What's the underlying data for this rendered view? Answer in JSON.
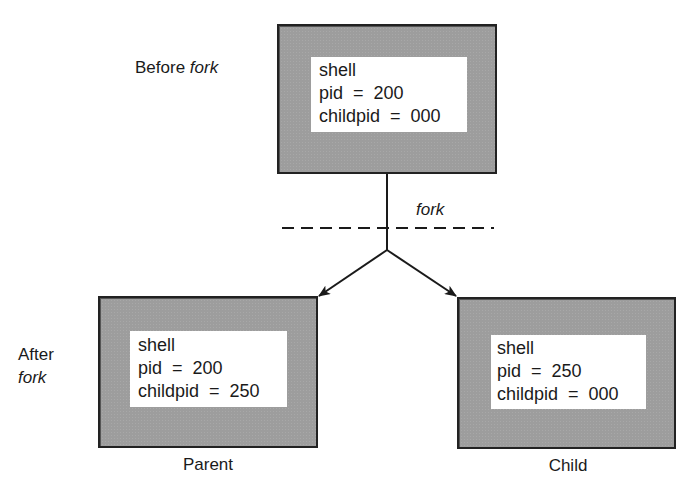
{
  "diagram": {
    "labels": {
      "before_prefix": "Before ",
      "before_italic": "fork",
      "after_line1": "After",
      "after_line2": "fork",
      "fork_edge": "fork"
    },
    "processes": {
      "before": {
        "caption": "",
        "name": "shell",
        "pid_line": "pid  =  200",
        "childpid_line": "childpid  =  000",
        "pid": 200,
        "childpid": "000"
      },
      "parent": {
        "caption": "Parent",
        "name": "shell",
        "pid_line": "pid  =  200",
        "childpid_line": "childpid  =  250",
        "pid": 200,
        "childpid": 250
      },
      "child": {
        "caption": "Child",
        "name": "shell",
        "pid_line": "pid  =  250",
        "childpid_line": "childpid  =  000",
        "pid": 250,
        "childpid": "000"
      }
    },
    "edges": [
      {
        "from": "before",
        "to": "fork-point",
        "style": "solid"
      },
      {
        "from": "fork-point",
        "to": "parent",
        "style": "arrow"
      },
      {
        "from": "fork-point",
        "to": "child",
        "style": "arrow"
      }
    ],
    "separator": {
      "style": "dashed",
      "label": "fork"
    },
    "colors": {
      "box_fill": "#b7b7b7",
      "box_border": "#222222",
      "info_fill": "#ffffff",
      "line": "#1a1a1a",
      "text": "#1a1a1a"
    }
  }
}
